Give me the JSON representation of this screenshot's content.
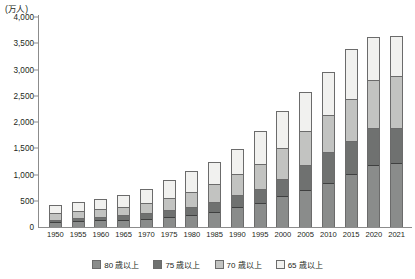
{
  "chart_data": {
    "type": "bar",
    "stacked": true,
    "title": "",
    "subtitle": "",
    "unit_label": "(万人)",
    "xlabel": "",
    "ylabel": "",
    "ylim": [
      0,
      4000
    ],
    "ytick_step": 500,
    "ytick_labels": [
      "4,000",
      "3,500",
      "3,000",
      "2,500",
      "2,000",
      "1,500",
      "1,000",
      "500",
      "0"
    ],
    "ytick_values": [
      4000,
      3500,
      3000,
      2500,
      2000,
      1500,
      1000,
      500,
      0
    ],
    "grid": false,
    "legend_position": "bottom",
    "categories": [
      "1950",
      "1955",
      "1960",
      "1965",
      "1970",
      "1975",
      "1980",
      "1985",
      "1990",
      "1995",
      "2000",
      "2005",
      "2010",
      "2015",
      "2020",
      "2021"
    ],
    "cumulative_note": "Series are cumulative age thresholds; segment height = difference between adjacent thresholds.",
    "cumulative_totals": {
      "65+": [
        411,
        475,
        535,
        618,
        733,
        887,
        1065,
        1247,
        1493,
        1828,
        2204,
        2576,
        2948,
        3387,
        3619,
        3640
      ],
      "70+": [
        253,
        289,
        329,
        383,
        443,
        539,
        655,
        820,
        1009,
        1194,
        1507,
        1831,
        2131,
        2424,
        2797,
        2867
      ],
      "75+": [
        129,
        152,
        180,
        208,
        247,
        303,
        366,
        471,
        597,
        717,
        901,
        1164,
        1422,
        1632,
        1872,
        1880
      ],
      "80+": [
        85,
        95,
        110,
        124,
        146,
        181,
        223,
        279,
        360,
        448,
        574,
        699,
        820,
        1002,
        1160,
        1206
      ]
    },
    "series": [
      {
        "name": "80 歳以上",
        "key": "s80",
        "color": "#8a8c8b",
        "values": [
          85,
          95,
          110,
          124,
          146,
          181,
          223,
          279,
          360,
          448,
          574,
          699,
          820,
          1002,
          1160,
          1206
        ]
      },
      {
        "name": "75 歳以上",
        "key": "s75",
        "color": "#6f7170",
        "values": [
          44,
          57,
          70,
          84,
          101,
          122,
          143,
          192,
          237,
          269,
          327,
          465,
          602,
          630,
          712,
          674
        ]
      },
      {
        "name": "70 歳以上",
        "key": "s70",
        "color": "#c2c3c1",
        "values": [
          124,
          137,
          149,
          175,
          196,
          236,
          289,
          349,
          412,
          477,
          606,
          667,
          709,
          792,
          925,
          987
        ]
      },
      {
        "name": "65 歳以上",
        "key": "s65",
        "color": "#f1f1ef",
        "values": [
          158,
          186,
          206,
          235,
          290,
          348,
          410,
          427,
          484,
          634,
          697,
          745,
          817,
          963,
          822,
          773
        ]
      }
    ],
    "legend": [
      {
        "label": "80 歳以上",
        "color": "#8a8c8b"
      },
      {
        "label": "75 歳以上",
        "color": "#6f7170"
      },
      {
        "label": "70 歳以上",
        "color": "#c2c3c1"
      },
      {
        "label": "65 歳以上",
        "color": "#f1f1ef"
      }
    ]
  }
}
